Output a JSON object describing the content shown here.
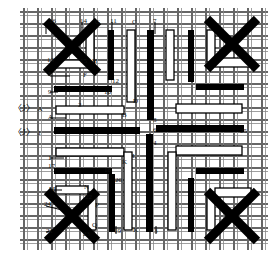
{
  "figure": {
    "type": "technical-line-drawing",
    "colors": {
      "ink": "#000000",
      "background": "#ffffff",
      "hatch": "#4a4a4a",
      "fill_white": "#ffffff"
    },
    "cross_marks": [
      {
        "name": "cross-top-left",
        "cx": 72,
        "cy": 47,
        "r": 26,
        "w": 9
      },
      {
        "name": "cross-top-right",
        "cx": 232,
        "cy": 44,
        "r": 25,
        "w": 9
      },
      {
        "name": "cross-bottom-left",
        "cx": 72,
        "cy": 216,
        "r": 25,
        "w": 9
      },
      {
        "name": "cross-bottom-right",
        "cx": 232,
        "cy": 216,
        "r": 25,
        "w": 9
      }
    ],
    "markers": [
      {
        "name": "marker-j-a",
        "bracket": "〈J〉",
        "suffix": "A",
        "x": 13,
        "y": 104
      },
      {
        "name": "marker-j-1",
        "bracket": "〈J〉",
        "suffix": "1",
        "x": 13,
        "y": 128
      }
    ],
    "labels": [
      {
        "text": "16",
        "x": 49,
        "y": 18
      },
      {
        "text": "14",
        "x": 80,
        "y": 18
      },
      {
        "text": "G",
        "x": 95,
        "y": 19
      },
      {
        "text": "11",
        "x": 110,
        "y": 18
      },
      {
        "text": "C",
        "x": 132,
        "y": 19
      },
      {
        "text": "7",
        "x": 153,
        "y": 18
      },
      {
        "text": "13",
        "x": 47,
        "y": 57
      },
      {
        "text": "15",
        "x": 80,
        "y": 58
      },
      {
        "text": "H",
        "x": 92,
        "y": 58
      },
      {
        "text": "E",
        "x": 48,
        "y": 71
      },
      {
        "text": "F",
        "x": 83,
        "y": 72
      },
      {
        "text": "12",
        "x": 112,
        "y": 78
      },
      {
        "text": "9",
        "x": 48,
        "y": 89
      },
      {
        "text": "10",
        "x": 104,
        "y": 89
      },
      {
        "text": "D",
        "x": 133,
        "y": 98
      },
      {
        "text": "2",
        "x": 78,
        "y": 102
      },
      {
        "text": "B",
        "x": 122,
        "y": 112
      },
      {
        "text": "A",
        "x": 48,
        "y": 114
      },
      {
        "text": "8",
        "x": 153,
        "y": 117
      },
      {
        "text": "6",
        "x": 153,
        "y": 127
      },
      {
        "text": "25",
        "x": 240,
        "y": 128
      },
      {
        "text": "4",
        "x": 153,
        "y": 140
      },
      {
        "text": "L",
        "x": 132,
        "y": 153
      },
      {
        "text": "K",
        "x": 122,
        "y": 159
      },
      {
        "text": "1",
        "x": 48,
        "y": 155
      },
      {
        "text": "17",
        "x": 48,
        "y": 163
      },
      {
        "text": "18",
        "x": 104,
        "y": 167
      },
      {
        "text": "20",
        "x": 115,
        "y": 177
      },
      {
        "text": "M",
        "x": 49,
        "y": 186
      },
      {
        "text": "N",
        "x": 84,
        "y": 184
      },
      {
        "text": "22",
        "x": 85,
        "y": 194
      },
      {
        "text": "24",
        "x": 44,
        "y": 201
      },
      {
        "text": "P",
        "x": 95,
        "y": 202
      },
      {
        "text": "Q",
        "x": 92,
        "y": 222
      },
      {
        "text": "21",
        "x": 46,
        "y": 228
      },
      {
        "text": "23",
        "x": 83,
        "y": 231
      },
      {
        "text": "19",
        "x": 114,
        "y": 228
      },
      {
        "text": "K",
        "x": 133,
        "y": 227
      },
      {
        "text": "3",
        "x": 154,
        "y": 228
      }
    ],
    "bars": {
      "horizontal_black": [
        {
          "name": "h-bar-9",
          "x": 54,
          "y": 86,
          "w": 58,
          "h": 6
        },
        {
          "name": "h-bar-1",
          "x": 54,
          "y": 127,
          "w": 86,
          "h": 7
        },
        {
          "name": "h-bar-6",
          "x": 156,
          "y": 125,
          "w": 88,
          "h": 7
        },
        {
          "name": "h-bar-17",
          "x": 54,
          "y": 168,
          "w": 58,
          "h": 6
        },
        {
          "name": "h-bar-r1",
          "x": 196,
          "y": 84,
          "w": 48,
          "h": 6
        },
        {
          "name": "h-bar-r2",
          "x": 196,
          "y": 168,
          "w": 48,
          "h": 6
        }
      ],
      "horizontal_white": [
        {
          "name": "h-white-15",
          "x": 56,
          "y": 60,
          "w": 38,
          "h": 8
        },
        {
          "name": "h-white-2",
          "x": 56,
          "y": 106,
          "w": 68,
          "h": 8
        },
        {
          "name": "h-white-18",
          "x": 56,
          "y": 148,
          "w": 68,
          "h": 8
        },
        {
          "name": "h-white-m",
          "x": 56,
          "y": 186,
          "w": 32,
          "h": 8
        },
        {
          "name": "h-white-r1",
          "x": 215,
          "y": 58,
          "w": 36,
          "h": 9
        },
        {
          "name": "h-white-r2",
          "x": 176,
          "y": 104,
          "w": 66,
          "h": 9
        },
        {
          "name": "h-white-r3",
          "x": 176,
          "y": 146,
          "w": 66,
          "h": 9
        },
        {
          "name": "h-white-r4",
          "x": 215,
          "y": 188,
          "w": 36,
          "h": 9
        }
      ],
      "vertical_black": [
        {
          "name": "v-bar-11",
          "x": 108,
          "y": 30,
          "w": 6,
          "h": 50
        },
        {
          "name": "v-bar-7",
          "x": 147,
          "y": 30,
          "w": 7,
          "h": 90
        },
        {
          "name": "v-bar-4",
          "x": 146,
          "y": 134,
          "w": 7,
          "h": 98
        },
        {
          "name": "v-bar-20",
          "x": 109,
          "y": 174,
          "w": 6,
          "h": 58
        },
        {
          "name": "v-bar-r1",
          "x": 188,
          "y": 30,
          "w": 6,
          "h": 52
        },
        {
          "name": "v-bar-r2",
          "x": 188,
          "y": 178,
          "w": 6,
          "h": 54
        }
      ],
      "vertical_white": [
        {
          "name": "v-white-g",
          "x": 86,
          "y": 30,
          "w": 8,
          "h": 34
        },
        {
          "name": "v-white-c",
          "x": 127,
          "y": 30,
          "w": 8,
          "h": 72
        },
        {
          "name": "v-white-d",
          "x": 166,
          "y": 30,
          "w": 8,
          "h": 50
        },
        {
          "name": "v-white-k",
          "x": 124,
          "y": 152,
          "w": 8,
          "h": 78
        },
        {
          "name": "v-white-q",
          "x": 88,
          "y": 194,
          "w": 8,
          "h": 36
        },
        {
          "name": "v-white-l",
          "x": 168,
          "y": 152,
          "w": 8,
          "h": 78
        },
        {
          "name": "v-white-r1",
          "x": 207,
          "y": 30,
          "w": 8,
          "h": 32
        },
        {
          "name": "v-white-r2",
          "x": 207,
          "y": 194,
          "w": 8,
          "h": 36
        }
      ]
    },
    "grid": {
      "horizontal_line_ys": [
        12,
        24,
        36,
        48,
        60,
        72,
        84,
        96,
        108,
        120,
        132,
        144,
        156,
        168,
        180,
        192,
        204,
        216,
        228,
        240
      ],
      "vertical_line_xs": [
        24,
        38,
        52,
        66,
        80,
        94,
        108,
        122,
        136,
        150,
        164,
        178,
        192,
        206,
        220,
        234,
        248,
        262
      ],
      "line_color": "#555555"
    }
  }
}
